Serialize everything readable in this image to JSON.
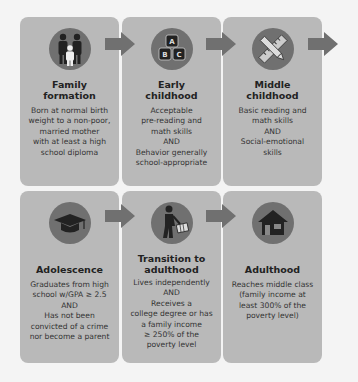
{
  "stages": [
    {
      "title_lines": [
        "Family",
        "formation"
      ],
      "icon": "family-icon",
      "desc_lines": [
        "Born at normal birth",
        "weight to a non-poor,",
        "married mother",
        "with at least a high",
        "school diploma"
      ]
    },
    {
      "title_lines": [
        "Early",
        "childhood"
      ],
      "icon": "abc-blocks-icon",
      "desc_lines": [
        "Acceptable",
        "pre-reading and",
        "math skills",
        "AND",
        "Behavior generally",
        "school-appropriate"
      ]
    },
    {
      "title_lines": [
        "Middle",
        "childhood"
      ],
      "icon": "pencil-ruler-icon",
      "desc_lines": [
        "Basic reading and",
        "math skills",
        "AND",
        "Social-emotional",
        "skills"
      ]
    },
    {
      "title_lines": [
        "Adolescence"
      ],
      "icon": "graduation-cap-icon",
      "desc_lines": [
        "Graduates from high",
        "school w/GPA ≥ 2.5",
        "AND",
        "Has not been",
        "convicted of a crime",
        "nor become a parent"
      ]
    },
    {
      "title_lines": [
        "Transition to",
        "adulthood"
      ],
      "icon": "person-with-briefcase-icon",
      "desc_lines": [
        "Lives independently",
        "AND",
        "Receives a",
        "college degree or has",
        "a family income",
        "≥ 250% of the",
        "poverty level"
      ]
    },
    {
      "title_lines": [
        "Adulthood"
      ],
      "icon": "house-icon",
      "desc_lines": [
        "Reaches middle class",
        "(family income at",
        "least 300% of the",
        "poverty level)"
      ]
    }
  ],
  "colors": {
    "card": "#b9b9b9",
    "icon_circle": "#707070",
    "arrow": "#707070",
    "background": "#f4f4f4"
  }
}
